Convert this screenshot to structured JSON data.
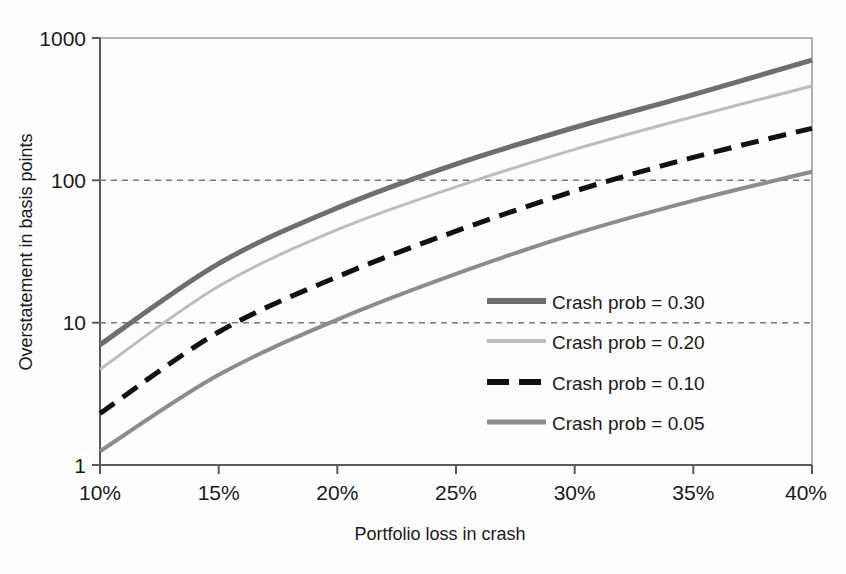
{
  "chart_data": {
    "type": "line",
    "title": "",
    "xlabel": "Portfolio loss in crash",
    "ylabel": "Overstatement in basis points",
    "yscale": "log",
    "ylim": [
      1,
      1000
    ],
    "xlim": [
      10,
      40
    ],
    "grid": "horizontal dashed at 10 and 100",
    "legend_position": "inside-right",
    "x": [
      10,
      15,
      20,
      25,
      30,
      35,
      40
    ],
    "xticklabels": [
      "10%",
      "15%",
      "20%",
      "25%",
      "30%",
      "35%",
      "40%"
    ],
    "yticklabels": [
      "1",
      "10",
      "100",
      "1000"
    ],
    "yticks": [
      1,
      10,
      100,
      1000
    ],
    "series": [
      {
        "name": "Crash prob = 0.30",
        "label": "Crash prob = 0.30",
        "color": "#6e6e6e",
        "width": 5,
        "dash": "none",
        "values": [
          7.0,
          26.0,
          64.0,
          130.0,
          235.0,
          400.0,
          700.0
        ]
      },
      {
        "name": "Crash prob = 0.20",
        "label": "Crash prob = 0.20",
        "color": "#bdbdbd",
        "width": 3,
        "dash": "none",
        "values": [
          4.7,
          18.0,
          45.0,
          90.0,
          165.0,
          280.0,
          460.0
        ]
      },
      {
        "name": "Crash prob = 0.10",
        "label": "Crash prob = 0.10",
        "color": "#111111",
        "width": 5,
        "dash": "18,10",
        "values": [
          2.3,
          8.6,
          21.0,
          44.0,
          84.0,
          145.0,
          232.0
        ]
      },
      {
        "name": "Crash prob = 0.05",
        "label": "Crash prob = 0.05",
        "color": "#8c8c8c",
        "width": 4,
        "dash": "none",
        "values": [
          1.25,
          4.3,
          10.5,
          22.0,
          42.0,
          72.0,
          115.0
        ]
      }
    ],
    "gridlines": [
      10,
      100
    ]
  },
  "axes": {
    "y_tick_1000": "1000",
    "y_tick_100": "100",
    "y_tick_10": "10",
    "y_tick_1": "1",
    "x_tick_10": "10%",
    "x_tick_15": "15%",
    "x_tick_20": "20%",
    "x_tick_25": "25%",
    "x_tick_30": "30%",
    "x_tick_35": "35%",
    "x_tick_40": "40%",
    "ylabel": "Overstatement in basis points",
    "xlabel": "Portfolio loss in crash"
  },
  "legend": {
    "items": [
      {
        "label": "Crash prob = 0.30"
      },
      {
        "label": "Crash prob = 0.20"
      },
      {
        "label": "Crash prob = 0.10"
      },
      {
        "label": "Crash prob = 0.05"
      }
    ]
  }
}
